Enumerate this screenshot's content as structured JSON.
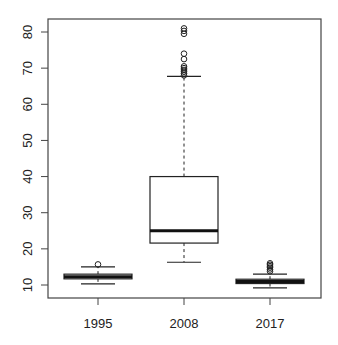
{
  "chart_data": {
    "type": "boxplot",
    "title": "",
    "xlabel": "",
    "ylabel": "",
    "ylim": [
      6.5,
      83.5
    ],
    "yticks": [
      10,
      20,
      30,
      40,
      50,
      60,
      70,
      80
    ],
    "ytick_labels": [
      "10",
      "20",
      "30",
      "40",
      "50",
      "60",
      "70",
      "80"
    ],
    "categories": [
      "1995",
      "2008",
      "2017"
    ],
    "grid": false,
    "legend": null,
    "boxes": [
      {
        "name": "1995",
        "whisker_low": 10.3,
        "q1": 11.7,
        "median": 12.3,
        "q3": 13.0,
        "whisker_high": 15.0,
        "outliers": [
          15.7
        ]
      },
      {
        "name": "2008",
        "whisker_low": 16.3,
        "q1": 21.6,
        "median": 25.0,
        "q3": 40.0,
        "whisker_high": 67.7,
        "outliers": [
          68.0,
          68.5,
          69.0,
          69.5,
          70.0,
          70.5,
          72.5,
          74.0,
          79.5,
          80.3,
          81.0
        ]
      },
      {
        "name": "2017",
        "whisker_low": 9.2,
        "q1": 10.4,
        "median": 11.0,
        "q3": 11.6,
        "whisker_high": 13.0,
        "outliers": [
          13.8,
          14.3,
          14.8,
          15.2,
          15.6,
          16.0
        ]
      }
    ]
  }
}
